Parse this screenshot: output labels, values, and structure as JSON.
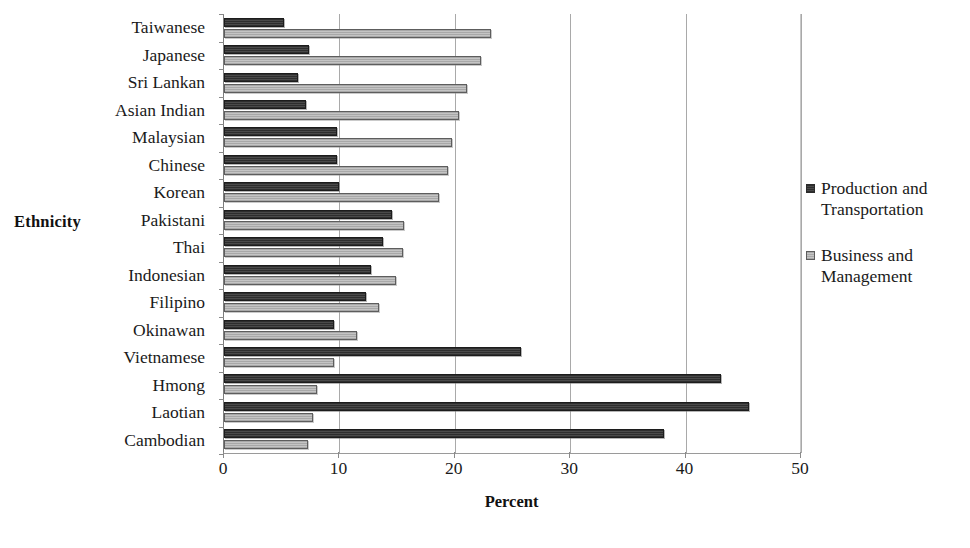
{
  "chart_data": {
    "type": "bar",
    "orientation": "horizontal",
    "title": "",
    "xlabel": "Percent",
    "ylabel": "Ethnicity",
    "xlim": [
      0,
      50
    ],
    "xticks": [
      0,
      10,
      20,
      30,
      40,
      50
    ],
    "grid": true,
    "legend_position": "right",
    "categories": [
      "Taiwanese",
      "Japanese",
      "Sri Lankan",
      "Asian Indian",
      "Malaysian",
      "Chinese",
      "Korean",
      "Pakistani",
      "Thai",
      "Indonesian",
      "Filipino",
      "Okinawan",
      "Vietnamese",
      "Hmong",
      "Laotian",
      "Cambodian"
    ],
    "series": [
      {
        "name": "Production and Transportation",
        "key": "production",
        "style": "dark",
        "values": [
          5.2,
          7.4,
          6.4,
          7.1,
          9.8,
          9.8,
          10.0,
          14.6,
          13.8,
          12.7,
          12.3,
          9.5,
          25.7,
          43.1,
          45.5,
          38.1
        ]
      },
      {
        "name": "Business and Management",
        "key": "business",
        "style": "light",
        "values": [
          23.1,
          22.3,
          21.1,
          20.4,
          19.8,
          19.4,
          18.6,
          15.6,
          15.5,
          14.9,
          13.4,
          11.5,
          9.5,
          8.1,
          7.7,
          7.3
        ]
      }
    ],
    "colors": {
      "dark": "#3a3a3a",
      "light": "#b4b4b4",
      "gridline": "#a9a9a9",
      "axis": "#8a8a8a",
      "text": "#1a1a1a"
    }
  },
  "axes": {
    "y_title": "Ethnicity",
    "x_title": "Percent"
  },
  "legend": {
    "entries": [
      {
        "label": "Production and Transportation",
        "line1": "Production and",
        "line2": "Transportation",
        "style": "dark"
      },
      {
        "label": "Business and Management",
        "line1": "Business and",
        "line2": "Management",
        "style": "light"
      }
    ]
  }
}
